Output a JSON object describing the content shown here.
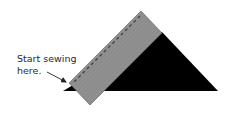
{
  "diagram": {
    "label": {
      "line1": "Start sewing",
      "line2": "here."
    },
    "colors": {
      "background": "#ffffff",
      "triangle": "#000000",
      "strip": "#8c8c8c",
      "strip_edge": "#555555",
      "stitch": "#3a3a3a",
      "arrow": "#222222",
      "text": "#2a2a2a"
    },
    "shapes": {
      "triangle_points": "63,91 162,32 218,91",
      "strip_points": "141,11 162,33 90,105 69,83",
      "stitch_line": {
        "x1": 140,
        "y1": 16,
        "x2": 73,
        "y2": 83
      },
      "arrow": {
        "x1": 47,
        "y1": 72,
        "x2": 67,
        "y2": 82
      }
    }
  }
}
